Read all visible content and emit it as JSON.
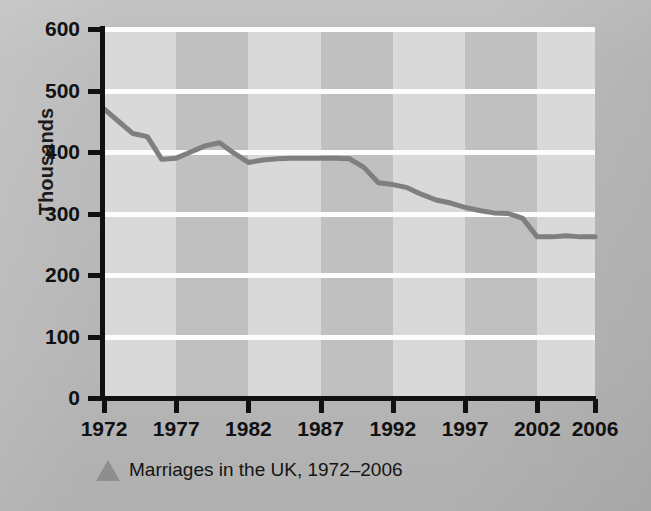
{
  "figure": {
    "caption": "Marriages in the UK, 1972–2006",
    "caption_marker": "triangle-marker"
  },
  "colors": {
    "line": "#7f7f7f",
    "band_light": "#d9d9d9",
    "band_dark": "#c0c0c0",
    "gridline": "#fdfdfd",
    "axis": "#111111",
    "page_background": "#b9b9b9",
    "caption_marker": "#8e8e8e"
  },
  "chart_data": {
    "type": "line",
    "title": "Marriages in the UK, 1972–2006",
    "xlabel": "",
    "ylabel": "Thousands",
    "xlim": [
      1972,
      2006
    ],
    "ylim": [
      0,
      600
    ],
    "grid": true,
    "legend": "none",
    "y_ticks": [
      600,
      500,
      400,
      300,
      200,
      100,
      0
    ],
    "x_ticks": [
      1972,
      1977,
      1982,
      1987,
      1992,
      1997,
      2002,
      2006
    ],
    "series": [
      {
        "name": "Marriages in the UK",
        "x": [
          1972,
          1973,
          1974,
          1975,
          1976,
          1977,
          1978,
          1979,
          1980,
          1981,
          1982,
          1983,
          1984,
          1985,
          1986,
          1987,
          1988,
          1989,
          1990,
          1991,
          1992,
          1993,
          1994,
          1995,
          1996,
          1997,
          1998,
          1999,
          2000,
          2001,
          2002,
          2003,
          2004,
          2005,
          2006
        ],
        "values": [
          470,
          450,
          430,
          425,
          388,
          390,
          400,
          410,
          415,
          398,
          383,
          387,
          389,
          390,
          390,
          390,
          390,
          389,
          375,
          350,
          347,
          342,
          331,
          322,
          317,
          310,
          305,
          301,
          300,
          292,
          262,
          262,
          264,
          262,
          262
        ]
      }
    ]
  }
}
